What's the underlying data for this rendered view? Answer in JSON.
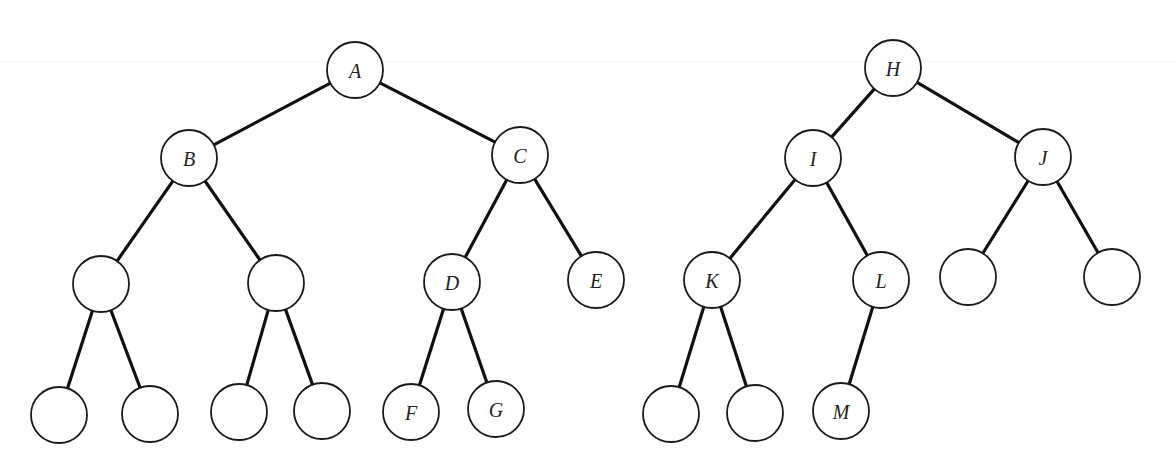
{
  "diagram": {
    "type": "binary-trees",
    "node_radius": 28,
    "colors": {
      "edge": "#111111",
      "node_stroke": "#1a1a1a",
      "node_fill": "#ffffff",
      "label": "#222222",
      "background": "#ffffff"
    },
    "trees": [
      {
        "name": "left-tree",
        "root": "A",
        "nodes": [
          {
            "id": "A",
            "label": "A",
            "x": 355,
            "y": 70
          },
          {
            "id": "B",
            "label": "B",
            "x": 189,
            "y": 158
          },
          {
            "id": "C",
            "label": "C",
            "x": 520,
            "y": 155
          },
          {
            "id": "B1",
            "label": "",
            "x": 101,
            "y": 284
          },
          {
            "id": "B2",
            "label": "",
            "x": 276,
            "y": 283
          },
          {
            "id": "D",
            "label": "D",
            "x": 452,
            "y": 282
          },
          {
            "id": "E",
            "label": "E",
            "x": 596,
            "y": 280
          },
          {
            "id": "B1L",
            "label": "",
            "x": 59,
            "y": 415
          },
          {
            "id": "B1R",
            "label": "",
            "x": 150,
            "y": 414
          },
          {
            "id": "B2L",
            "label": "",
            "x": 239,
            "y": 412
          },
          {
            "id": "B2R",
            "label": "",
            "x": 322,
            "y": 411
          },
          {
            "id": "F",
            "label": "F",
            "x": 411,
            "y": 412
          },
          {
            "id": "G",
            "label": "G",
            "x": 496,
            "y": 409
          }
        ],
        "edges": [
          [
            "A",
            "B"
          ],
          [
            "A",
            "C"
          ],
          [
            "B",
            "B1"
          ],
          [
            "B",
            "B2"
          ],
          [
            "C",
            "D"
          ],
          [
            "C",
            "E"
          ],
          [
            "B1",
            "B1L"
          ],
          [
            "B1",
            "B1R"
          ],
          [
            "B2",
            "B2L"
          ],
          [
            "B2",
            "B2R"
          ],
          [
            "D",
            "F"
          ],
          [
            "D",
            "G"
          ]
        ]
      },
      {
        "name": "right-tree",
        "root": "H",
        "nodes": [
          {
            "id": "H",
            "label": "H",
            "x": 893,
            "y": 68
          },
          {
            "id": "I",
            "label": "I",
            "x": 813,
            "y": 158
          },
          {
            "id": "J",
            "label": "J",
            "x": 1043,
            "y": 157
          },
          {
            "id": "K",
            "label": "K",
            "x": 712,
            "y": 280
          },
          {
            "id": "L",
            "label": "L",
            "x": 881,
            "y": 280
          },
          {
            "id": "J1",
            "label": "",
            "x": 968,
            "y": 277
          },
          {
            "id": "J2",
            "label": "",
            "x": 1112,
            "y": 277
          },
          {
            "id": "K1",
            "label": "",
            "x": 671,
            "y": 414
          },
          {
            "id": "K2",
            "label": "",
            "x": 755,
            "y": 413
          },
          {
            "id": "M",
            "label": "M",
            "x": 841,
            "y": 411
          }
        ],
        "edges": [
          [
            "H",
            "I"
          ],
          [
            "H",
            "J"
          ],
          [
            "I",
            "K"
          ],
          [
            "I",
            "L"
          ],
          [
            "J",
            "J1"
          ],
          [
            "J",
            "J2"
          ],
          [
            "K",
            "K1"
          ],
          [
            "K",
            "K2"
          ],
          [
            "L",
            "M"
          ]
        ]
      }
    ]
  }
}
